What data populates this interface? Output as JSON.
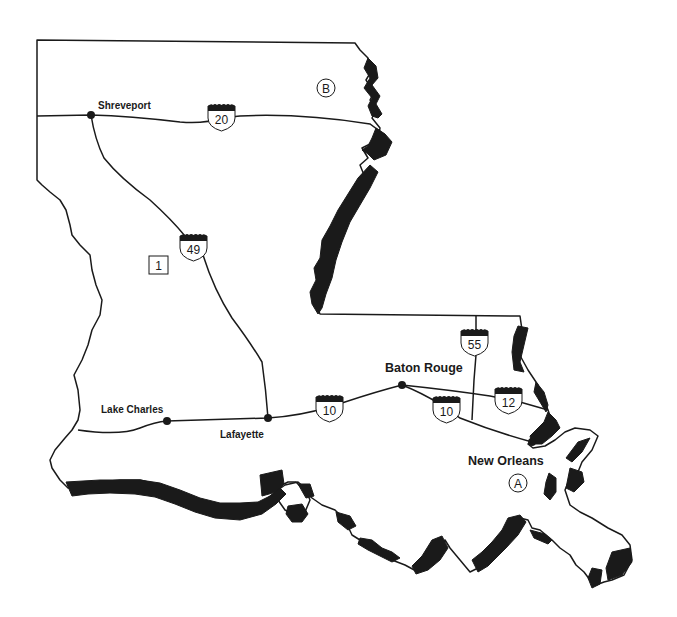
{
  "map": {
    "subject": "Louisiana",
    "cities": [
      {
        "name": "Shreveport",
        "x": 91,
        "y": 115,
        "label_x": 98,
        "label_y": 109,
        "size": "small"
      },
      {
        "name": "Lake Charles",
        "x": 167,
        "y": 421,
        "label_x": 101,
        "label_y": 413,
        "size": "small"
      },
      {
        "name": "Lafayette",
        "x": 268,
        "y": 418,
        "label_x": 220,
        "label_y": 438,
        "size": "small"
      },
      {
        "name": "Baton Rouge",
        "x": 402,
        "y": 385,
        "label_x": 385,
        "label_y": 372,
        "size": "large"
      },
      {
        "name": "New Orleans",
        "x": 532,
        "y": 442,
        "label_x": 468,
        "label_y": 465,
        "size": "large"
      }
    ],
    "interstates": [
      {
        "number": "20",
        "x": 221,
        "y": 116
      },
      {
        "number": "49",
        "x": 193,
        "y": 246
      },
      {
        "number": "10",
        "x": 329,
        "y": 407
      },
      {
        "number": "10",
        "x": 446,
        "y": 408
      },
      {
        "number": "55",
        "x": 474,
        "y": 341
      },
      {
        "number": "12",
        "x": 508,
        "y": 399
      }
    ],
    "markers": [
      {
        "id": "A",
        "shape": "circle",
        "x": 518,
        "y": 483
      },
      {
        "id": "B",
        "shape": "circle",
        "x": 326,
        "y": 88
      },
      {
        "id": "1",
        "shape": "square",
        "x": 158,
        "y": 265
      }
    ]
  }
}
